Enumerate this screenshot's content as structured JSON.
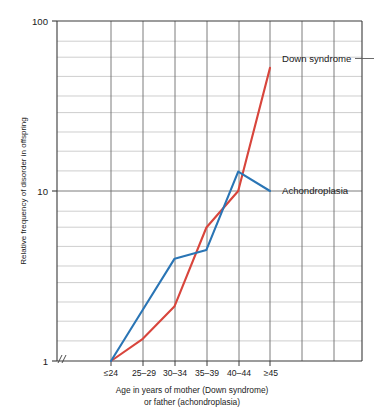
{
  "chart_data": {
    "type": "line",
    "title": "",
    "xlabel": "Age in years of mother (Down syndrome) or father (achondroplasia)",
    "xlabel_line1": "Age in years of mother (Down syndrome)",
    "xlabel_line2": "or father (achondroplasia)",
    "ylabel": "Relative frequency of disorder in offspring",
    "yscale": "log",
    "ylim": [
      1,
      100
    ],
    "ytick_labels": [
      "1",
      "100",
      "10"
    ],
    "ytick_values": [
      1,
      100,
      10
    ],
    "grid": true,
    "axis_break": "//",
    "legend_position": "inline-right",
    "categories": [
      "≤24",
      "25–29",
      "30–34",
      "35–39",
      "40–44",
      "≥45"
    ],
    "series": [
      {
        "name": "Down syndrome",
        "color": "#d8453c",
        "values": [
          1.0,
          1.35,
          2.1,
          6.1,
          10.0,
          53.0
        ]
      },
      {
        "name": "Achondroplasia",
        "color": "#2a75b5",
        "values": [
          1.0,
          2.0,
          4.0,
          4.5,
          13.0,
          10.0
        ]
      }
    ],
    "annotations": [
      {
        "text": "Down syndrome",
        "series": "Down syndrome",
        "at_category": "≥45"
      },
      {
        "text": "Achondroplasia",
        "series": "Achondroplasia",
        "at_category": "≥45"
      }
    ]
  }
}
